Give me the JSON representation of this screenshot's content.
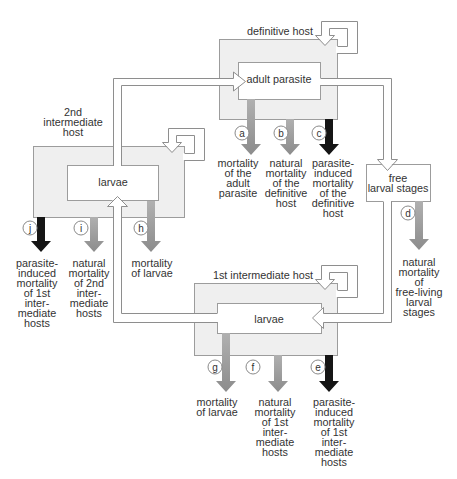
{
  "figure": {
    "definitive_host": {
      "label": "definitive host",
      "stage": "adult parasite"
    },
    "second_intermediate_host": {
      "label_lines": [
        "2nd",
        "intermediate",
        "host"
      ],
      "stage": "larvae"
    },
    "first_intermediate_host": {
      "label": "1st intermediate host",
      "stage": "larvae"
    },
    "free_larval_stages": {
      "label_lines": [
        "free",
        "larval stages"
      ]
    }
  },
  "mortality": {
    "a": {
      "marker": "a",
      "type": "grey",
      "lines": [
        "mortality",
        "of the",
        "adult",
        "parasite"
      ]
    },
    "b": {
      "marker": "b",
      "type": "grey",
      "lines": [
        "natural",
        "mortality",
        "of the",
        "definitive",
        "host"
      ]
    },
    "c": {
      "marker": "c",
      "type": "black",
      "lines": [
        "parasite-",
        "induced",
        "mortality",
        "of the",
        "definitive",
        "host"
      ]
    },
    "d": {
      "marker": "d",
      "type": "grey",
      "lines": [
        "natural",
        "mortality",
        "of",
        "free-living",
        "larval",
        "stages"
      ]
    },
    "e": {
      "marker": "e",
      "type": "black",
      "lines": [
        "parasite-",
        "induced",
        "mortality",
        "of 1st",
        "inter-",
        "mediate",
        "hosts"
      ]
    },
    "f": {
      "marker": "f",
      "type": "grey",
      "lines": [
        "natural",
        "mortality",
        "of 1st",
        "inter-",
        "mediate",
        "hosts"
      ]
    },
    "g": {
      "marker": "g",
      "type": "grey",
      "lines": [
        "mortality",
        "of larvae"
      ]
    },
    "h": {
      "marker": "h",
      "type": "grey",
      "lines": [
        "mortality",
        "of larvae"
      ]
    },
    "i": {
      "marker": "i",
      "type": "grey",
      "lines": [
        "natural",
        "mortality",
        "of 2nd",
        "inter-",
        "mediate",
        "hosts"
      ]
    },
    "j": {
      "marker": "j",
      "type": "black",
      "lines": [
        "parasite-",
        "induced",
        "mortality",
        "of 1st",
        "inter-",
        "mediate",
        "hosts"
      ]
    }
  },
  "colors": {
    "host_fill": "#efefef",
    "arrow_grey_light": "#b0b0b0",
    "arrow_grey_dark": "#8c8c8c",
    "arrow_black": "#151515"
  }
}
